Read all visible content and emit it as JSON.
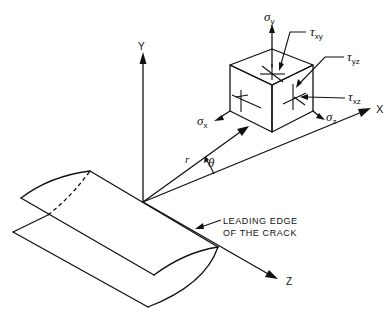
{
  "figure": {
    "type": "crack-tip coordinate system with stress element",
    "axes": {
      "x_label": "X",
      "y_label": "Y",
      "z_label": "Z"
    },
    "polar": {
      "r_label": "r",
      "theta_label": "θ"
    },
    "stresses": {
      "sigma_x": {
        "symbol": "σ",
        "sub": "x"
      },
      "sigma_y": {
        "symbol": "σ",
        "sub": "y"
      },
      "sigma_z": {
        "symbol": "σ",
        "sub": "z"
      },
      "tau_xy": {
        "symbol": "τ",
        "sub": "xy"
      },
      "tau_yz": {
        "symbol": "τ",
        "sub": "yz"
      },
      "tau_xz": {
        "symbol": "τ",
        "sub": "xz"
      }
    },
    "annotation": {
      "line1": "LEADING EDGE",
      "line2": "OF THE CRACK"
    }
  }
}
